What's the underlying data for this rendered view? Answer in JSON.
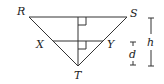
{
  "diagram": {
    "type": "geometry-triangle",
    "vertices": {
      "R": {
        "label": "R",
        "x": 29,
        "y": 17
      },
      "S": {
        "label": "S",
        "x": 127,
        "y": 17
      },
      "T": {
        "label": "T",
        "x": 78,
        "y": 66
      },
      "X": {
        "label": "X",
        "x": 53,
        "y": 41
      },
      "Y": {
        "label": "Y",
        "x": 103,
        "y": 41
      }
    },
    "dimensions": {
      "h": {
        "label": "h"
      },
      "d": {
        "label": "d"
      }
    },
    "colors": {
      "line": "#333333",
      "text": "#222222",
      "background": "#ffffff"
    }
  }
}
